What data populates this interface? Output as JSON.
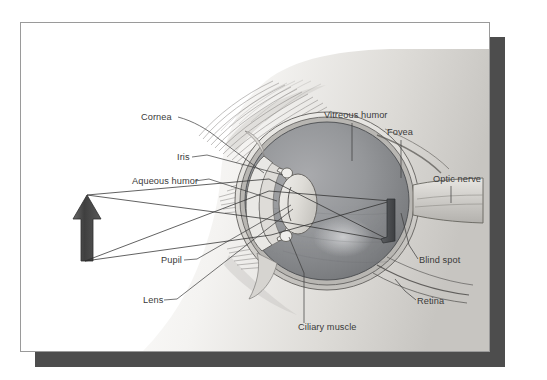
{
  "figure": {
    "plate": {
      "background_color": "#ffffff",
      "border_color": "#9a9a9a",
      "shadow_color": "#4d4d4d"
    },
    "labels": [
      {
        "id": "cornea",
        "text": "Cornea",
        "x": 120,
        "y": 97,
        "anchor": "start"
      },
      {
        "id": "iris",
        "text": "Iris",
        "x": 156,
        "y": 137,
        "anchor": "start"
      },
      {
        "id": "aqueous-humor",
        "text": "Aqueous humor",
        "x": 111,
        "y": 161,
        "anchor": "start"
      },
      {
        "id": "pupil",
        "text": "Pupil",
        "x": 140,
        "y": 240,
        "anchor": "start"
      },
      {
        "id": "lens",
        "text": "Lens",
        "x": 122,
        "y": 280,
        "anchor": "start"
      },
      {
        "id": "ciliary-muscle",
        "text": "Ciliary muscle",
        "x": 277,
        "y": 307,
        "anchor": "start"
      },
      {
        "id": "vitreous-humor",
        "text": "Vitreous humor",
        "x": 303,
        "y": 95,
        "anchor": "start"
      },
      {
        "id": "fovea",
        "text": "Fovea",
        "x": 366,
        "y": 112,
        "anchor": "start"
      },
      {
        "id": "optic-nerve",
        "text": "Optic nerve",
        "x": 412,
        "y": 159,
        "anchor": "start"
      },
      {
        "id": "blind-spot",
        "text": "Blind spot",
        "x": 398,
        "y": 240,
        "anchor": "start"
      },
      {
        "id": "retina",
        "text": "Retina",
        "x": 396,
        "y": 281,
        "anchor": "start"
      }
    ],
    "colors": {
      "label_text": "#3a3a3a",
      "leader_line": "#3a3a3a",
      "ray_line": "#2e2e2e",
      "arrow_object": "#4a4a4a",
      "vitreous_fill": "#8f9194",
      "sclera_fill": "#d8d6d2",
      "lens_fill": "#e2e0dc",
      "skin_light": "#f2f1ef",
      "skin_mid": "#cfcdc9"
    },
    "object_arrow": {
      "description": "upright dark arrow object to the left of the eye",
      "tip_x": 86,
      "tip_y": 172,
      "base_y": 236
    },
    "projected_image": {
      "description": "inverted image formed on the retina",
      "x": 370,
      "y_top": 178,
      "y_bottom": 218
    }
  }
}
